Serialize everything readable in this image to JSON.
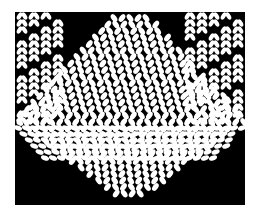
{
  "image": {
    "description": "Black-and-white illustration of knitted fabric: a diamond/triangular panel of stockinette stitches in the center, lace-like vertical stitch columns on both sides, and a V-shaped lower edge against a black background",
    "colors": {
      "background": "#ffffff",
      "frame": "#000000",
      "stitch": "#ffffff"
    }
  }
}
